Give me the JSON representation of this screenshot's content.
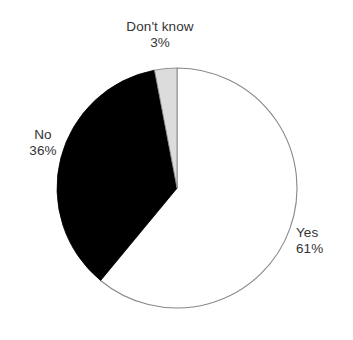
{
  "chart_data": {
    "type": "pie",
    "title": "",
    "categories": [
      "Yes",
      "No",
      "Don't know"
    ],
    "values": [
      61,
      36,
      3
    ],
    "value_unit": "%",
    "start_angle_deg": 0,
    "direction": "clockwise",
    "legend_position": "none",
    "labels_position": "outside",
    "slices": [
      {
        "name": "Yes",
        "value": 61,
        "value_label": "61%",
        "fill": "#ffffff",
        "stroke": "#888888"
      },
      {
        "name": "No",
        "value": 36,
        "value_label": "36%",
        "fill": "#000000",
        "stroke": "#000000"
      },
      {
        "name": "Don't know",
        "value": 3,
        "value_label": "3%",
        "fill": "#dcdcdc",
        "stroke": "#888888"
      }
    ]
  },
  "labels": {
    "dont_know": {
      "name": "Don't know",
      "value": "3%"
    },
    "no": {
      "name": "No",
      "value": "36%"
    },
    "yes": {
      "name": "Yes",
      "value": "61%"
    }
  },
  "colors": {
    "text": "#333333",
    "background": "#ffffff",
    "slice_white": "#ffffff",
    "slice_black": "#000000",
    "slice_gray": "#dcdcdc",
    "outline": "#888888"
  }
}
